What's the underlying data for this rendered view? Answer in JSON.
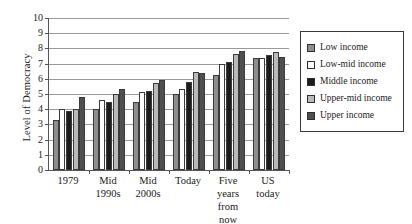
{
  "chart_data": {
    "type": "bar",
    "title": "",
    "xlabel": "",
    "ylabel": "Level of Democracy",
    "ylim": [
      0,
      10
    ],
    "yticks": [
      0,
      1,
      2,
      3,
      4,
      5,
      6,
      7,
      8,
      9,
      10
    ],
    "grid": true,
    "legend_position": "right",
    "categories": [
      "1979",
      "Mid\n1990s",
      "Mid\n2000s",
      "Today",
      "Five years\nfrom now",
      "US\ntoday"
    ],
    "series": [
      {
        "name": "Low income",
        "color": "#8e8e8e",
        "values": [
          3.3,
          4.0,
          4.45,
          5.0,
          6.25,
          7.4
        ]
      },
      {
        "name": "Low-mid income",
        "color": "#ffffff",
        "values": [
          4.0,
          4.6,
          5.1,
          5.35,
          7.0,
          7.4
        ]
      },
      {
        "name": "Middle income",
        "color": "#1c1c1c",
        "values": [
          3.9,
          4.5,
          5.2,
          5.8,
          7.1,
          7.55
        ]
      },
      {
        "name": "Upper-mid income",
        "color": "#b9b9b9",
        "values": [
          4.0,
          5.0,
          5.75,
          6.45,
          7.6,
          7.75
        ]
      },
      {
        "name": "Upper income",
        "color": "#4f4f4f",
        "values": [
          4.8,
          5.3,
          5.95,
          6.4,
          7.8,
          7.45
        ]
      }
    ]
  }
}
